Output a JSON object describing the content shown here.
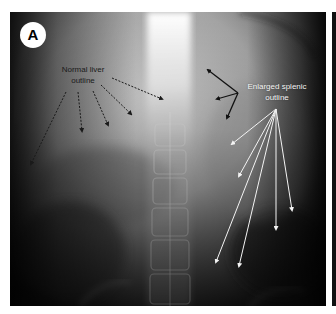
{
  "figure": {
    "panel_label": "A",
    "image_type": "abdominal-radiograph",
    "annotations": [
      {
        "id": "liver",
        "text_line1": "Normal liver",
        "text_line2": "outline",
        "text_color": "#1a1a1a",
        "arrow_style": "dashed",
        "arrow_color": "#1a1a1a",
        "arrows": [
          {
            "from": [
              56,
              80
            ],
            "to": [
              21,
              152
            ]
          },
          {
            "from": [
              68,
              80
            ],
            "to": [
              72,
              119
            ]
          },
          {
            "from": [
              83,
              79
            ],
            "to": [
              98,
              113
            ]
          },
          {
            "from": [
              91,
              73
            ],
            "to": [
              121,
              102
            ]
          },
          {
            "from": [
              102,
              66
            ],
            "to": [
              152,
              87
            ]
          }
        ]
      },
      {
        "id": "black-arrows",
        "arrow_style": "solid",
        "arrow_color": "#111111",
        "arrows": [
          {
            "from": [
              228,
              81
            ],
            "to": [
              198,
              58
            ]
          },
          {
            "from": [
              228,
              81
            ],
            "to": [
              207,
              87
            ]
          },
          {
            "from": [
              228,
              81
            ],
            "to": [
              217,
              106
            ]
          }
        ]
      },
      {
        "id": "spleen",
        "text_line1": "Enlarged splenic",
        "text_line2": "outline",
        "text_color": "#f4f4f4",
        "arrow_style": "solid",
        "arrow_color": "#f4f4f4",
        "arrows": [
          {
            "from": [
              266,
              97
            ],
            "to": [
              222,
              132
            ]
          },
          {
            "from": [
              266,
              97
            ],
            "to": [
              229,
              164
            ]
          },
          {
            "from": [
              266,
              97
            ],
            "to": [
              282,
              198
            ]
          },
          {
            "from": [
              266,
              97
            ],
            "to": [
              266,
              217
            ]
          },
          {
            "from": [
              266,
              97
            ],
            "to": [
              206,
              250
            ]
          },
          {
            "from": [
              266,
              97
            ],
            "to": [
              229,
              254
            ]
          }
        ]
      }
    ]
  }
}
